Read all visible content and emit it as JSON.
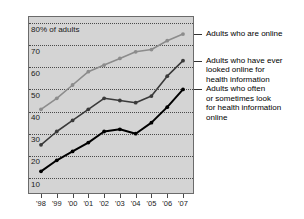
{
  "chart_data": {
    "type": "line",
    "title": "",
    "xlabel": "",
    "ylabel": "80% of adults",
    "ylim": [
      0,
      80
    ],
    "yticks": [
      10,
      20,
      30,
      40,
      50,
      60,
      70,
      80
    ],
    "ytick_labels": [
      "10",
      "20",
      "30",
      "40",
      "50",
      "60",
      "70",
      "80% of adults"
    ],
    "grid": true,
    "legend_position": "right",
    "categories": [
      "'98",
      "'99",
      "'00",
      "'01",
      "'02",
      "'03",
      "'04",
      "'05",
      "'06",
      "'07"
    ],
    "series": [
      {
        "name": "Adults who are online",
        "color": "#8c8c8c",
        "values": [
          41,
          46,
          52,
          58,
          61,
          64,
          67,
          68,
          72,
          75
        ]
      },
      {
        "name": "Adults who have ever looked online for health information",
        "color": "#3a3a3a",
        "values": [
          25,
          31,
          36,
          41,
          46,
          45,
          44,
          47,
          56,
          63
        ]
      },
      {
        "name": "Adults who often or sometimes look for health information online",
        "color": "#000000",
        "values": [
          13,
          18,
          22,
          26,
          31,
          32,
          30,
          35,
          42,
          50
        ]
      }
    ]
  },
  "legend": {
    "entries": [
      {
        "label": "Adults who are online",
        "lines": [
          "Adults who are online"
        ]
      },
      {
        "label": "Adults who have ever looked online for health information",
        "lines": [
          "Adults who have ever",
          "looked online for",
          "health information"
        ]
      },
      {
        "label": "Adults who often or sometimes look for health information online",
        "lines": [
          "Adults who often",
          "or sometimes look",
          "for health information",
          "online"
        ]
      }
    ]
  },
  "axis": {
    "y_title": "80% of adults",
    "y_ticks": [
      "70",
      "60",
      "50",
      "40",
      "30",
      "20",
      "10"
    ],
    "x_ticks": [
      "'98",
      "'99",
      "'00",
      "'01",
      "'02",
      "'03",
      "'04",
      "'05",
      "'06",
      "'07"
    ]
  },
  "colors": {
    "plot_background": "#d4d4d4",
    "page_background": "#ffffff",
    "grid": "#4a4a4a",
    "frame": "#6b6b6b",
    "series_online": "#8c8c8c",
    "series_ever": "#3a3a3a",
    "series_often": "#000000"
  }
}
